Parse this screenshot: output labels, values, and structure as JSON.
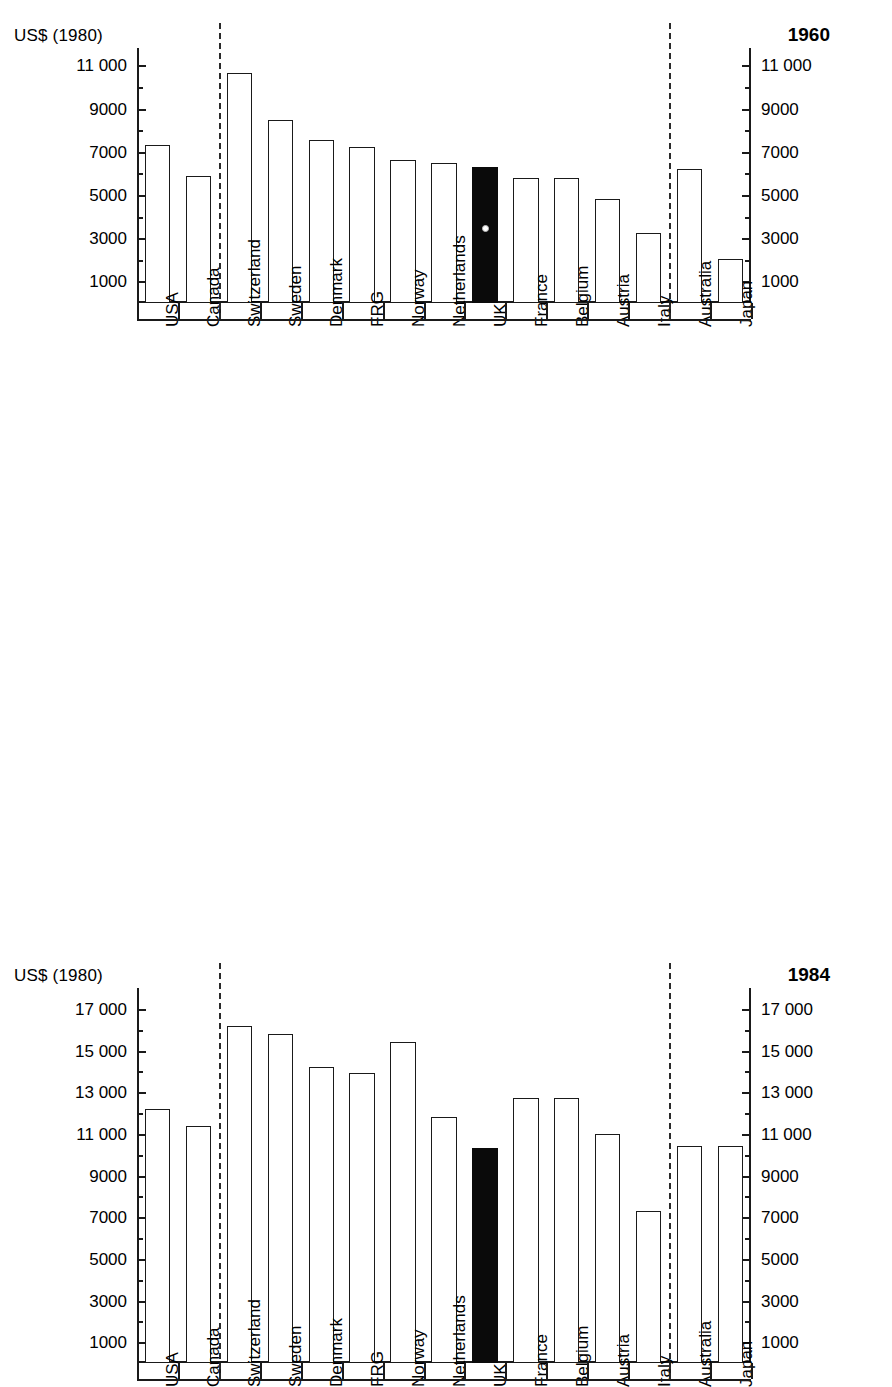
{
  "figure": {
    "unit_label": "US$ (1980)"
  },
  "chart_data": [
    {
      "id": "chart-1960",
      "type": "bar",
      "title": "1960",
      "xlabel": "",
      "ylabel": "US$ (1980)",
      "ylim": [
        0,
        11800
      ],
      "grid": false,
      "legend": "none",
      "ytick_labels": [
        "1000",
        "3000",
        "5000",
        "7000",
        "9000",
        "11 000"
      ],
      "ytick_values": [
        1000,
        3000,
        5000,
        7000,
        9000,
        11000
      ],
      "yminor_values": [
        2000,
        4000,
        6000,
        8000,
        10000
      ],
      "axis_left_labels": [
        "11 000",
        "9000",
        "7000",
        "5000",
        "3000",
        "1000"
      ],
      "axis_right_labels": [
        "11 000",
        "9000",
        "7000",
        "5000",
        "3000",
        "1000"
      ],
      "categories": [
        "USA",
        "Canada",
        "Switzerland",
        "Sweden",
        "Denmark",
        "FRG",
        "Norway",
        "Netherlands",
        "UK",
        "France",
        "Belgium",
        "Austria",
        "Italy",
        "Australia",
        "Japan"
      ],
      "values": [
        7300,
        5900,
        10650,
        8450,
        7550,
        7200,
        6600,
        6500,
        6300,
        5800,
        5800,
        4800,
        3250,
        6200,
        2050
      ],
      "highlight_category": "UK",
      "highlight_color": "#0a0a0a",
      "group_breaks_after": [
        "Canada",
        "Italy"
      ],
      "annotations": [
        "dashed separator after Canada",
        "dashed separator after Italy",
        "UK bar filled black"
      ]
    },
    {
      "id": "chart-1984",
      "type": "bar",
      "title": "1984",
      "xlabel": "",
      "ylabel": "US$ (1980)",
      "ylim": [
        0,
        18000
      ],
      "grid": false,
      "legend": "none",
      "ytick_labels": [
        "1000",
        "3000",
        "5000",
        "7000",
        "9000",
        "11 000",
        "13 000",
        "15 000",
        "17 000"
      ],
      "ytick_values": [
        1000,
        3000,
        5000,
        7000,
        9000,
        11000,
        13000,
        15000,
        17000
      ],
      "yminor_values": [
        2000,
        4000,
        6000,
        8000,
        10000,
        12000,
        14000,
        16000
      ],
      "axis_left_labels": [
        "17 000",
        "15 000",
        "13 000",
        "11 000",
        "9000",
        "7000",
        "5000",
        "3000",
        "1000"
      ],
      "axis_right_labels": [
        "17 000",
        "15 000",
        "13 000",
        "11 000",
        "9000",
        "7000",
        "5000",
        "3000",
        "1000"
      ],
      "categories": [
        "USA",
        "Canada",
        "Switzerland",
        "Sweden",
        "Denmark",
        "FRG",
        "Norway",
        "Netherlands",
        "UK",
        "France",
        "Belgium",
        "Austria",
        "Italy",
        "Australia",
        "Japan"
      ],
      "values": [
        12200,
        11400,
        16200,
        15800,
        14200,
        13900,
        15400,
        11800,
        10300,
        12700,
        12700,
        11000,
        7300,
        10400,
        10400
      ],
      "highlight_category": "UK",
      "highlight_color": "#0a0a0a",
      "group_breaks_after": [
        "Canada",
        "Italy"
      ],
      "annotations": [
        "dashed separator after Canada",
        "dashed separator after Italy",
        "UK bar filled black"
      ]
    }
  ]
}
